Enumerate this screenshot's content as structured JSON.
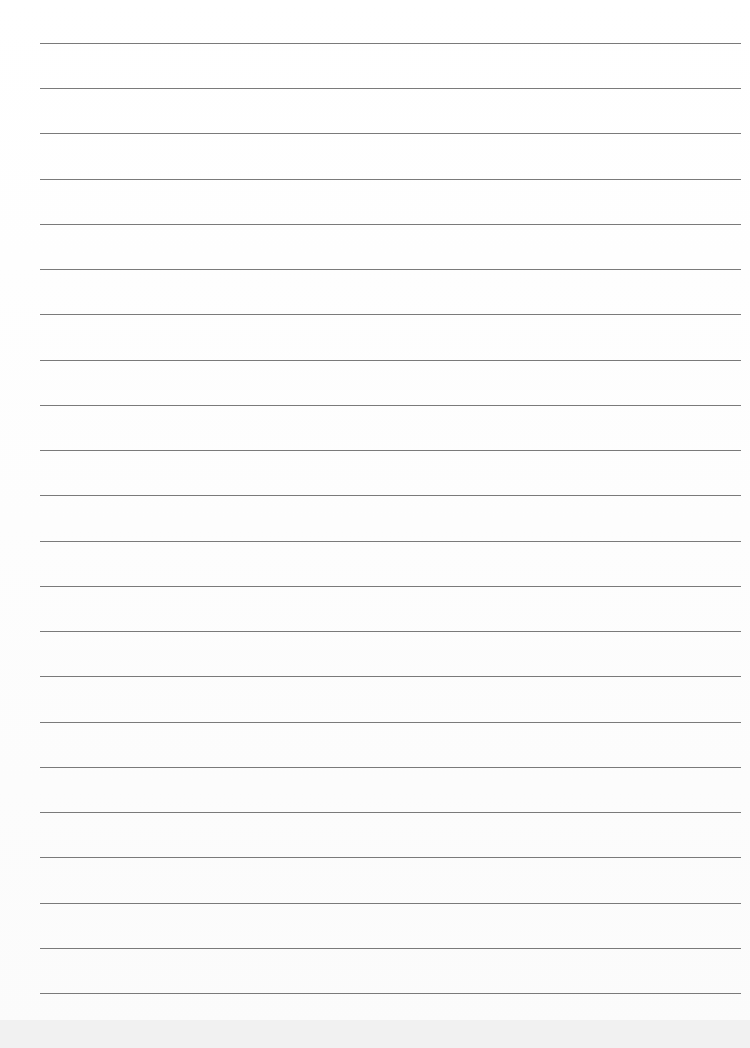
{
  "document": {
    "type": "lined-paper",
    "line_count": 22,
    "line_color": "#7a7a7a",
    "paper_color": "#ffffff"
  }
}
